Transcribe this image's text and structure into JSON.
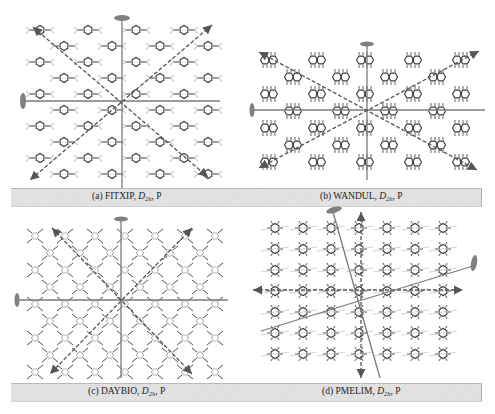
{
  "figure": {
    "panels": [
      {
        "id": "a",
        "label": "(a)",
        "name": "FITXIP",
        "group_main": "D",
        "group_sub": "2h",
        "suffix": ", P",
        "pattern": "para-substituted benzene rings, square lattice",
        "axes": {
          "c2_solid": [
            "vertical",
            "horizontal"
          ],
          "dashed_arrows": [
            "diagonal-45",
            "diagonal-135"
          ]
        }
      },
      {
        "id": "b",
        "label": "(b)",
        "name": "WANDUL",
        "group_main": "D",
        "group_sub": "2h",
        "suffix": ", P",
        "pattern": "naphthalene-like fused rings, staggered rows",
        "axes": {
          "c2_solid": [
            "vertical",
            "horizontal"
          ],
          "dashed_arrows": [
            "diagonal-shallow-up",
            "diagonal-shallow-down"
          ]
        }
      },
      {
        "id": "c",
        "label": "(c)",
        "name": "DAYBIO",
        "group_main": "D",
        "group_sub": "2h",
        "suffix": ", P",
        "pattern": "tetrasubstituted rings, diamond lattice",
        "axes": {
          "c2_solid": [
            "vertical",
            "horizontal"
          ],
          "dashed_arrows": [
            "diagonal-steep-up",
            "diagonal-steep-down"
          ]
        }
      },
      {
        "id": "d",
        "label": "(d)",
        "name": "PMELIM",
        "group_main": "D",
        "group_sub": "2h",
        "suffix": ", P",
        "pattern": "hexasubstituted rings, tilted rows",
        "axes": {
          "c2_solid": [
            "tilted-near-vertical",
            "tilted-near-horizontal"
          ],
          "dashed_arrows": [
            "vertical",
            "horizontal"
          ]
        }
      }
    ],
    "colors": {
      "axis": "#7a7a7a",
      "arrow": "#555555",
      "molecule": "#3a3a3a",
      "molecule_light": "#b5b5b5",
      "caption_bg": "#e0e0e0",
      "caption_text": "#222222"
    }
  }
}
